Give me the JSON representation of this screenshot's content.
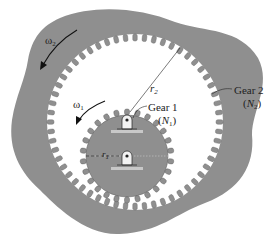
{
  "diagram": {
    "type": "planetary internal gear pair",
    "colors": {
      "body": "#8f8f8f",
      "background": "#ffffff",
      "line": "#222222",
      "bearing_base": "#c8c8c8"
    },
    "labels": {
      "omega2": {
        "sym": "ω",
        "sub": "2"
      },
      "omega1": {
        "sym": "ω",
        "sub": "1"
      },
      "r2": {
        "sym": "r",
        "sub": "2"
      },
      "r1": {
        "sym": "r",
        "sub": "1"
      },
      "gear1": {
        "name": "Gear 1",
        "count_open": "(",
        "count_sym": "N",
        "count_sub": "1",
        "count_close": ")"
      },
      "gear2": {
        "name": "Gear 2",
        "count_open": "(",
        "count_sym": "N",
        "count_sub": "2",
        "count_close": ")"
      }
    }
  }
}
